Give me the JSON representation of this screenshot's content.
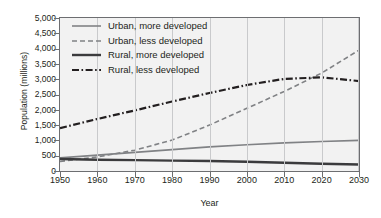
{
  "chart_data": {
    "type": "line",
    "title": "",
    "xlabel": "Year",
    "ylabel": "Population (millions)",
    "xlim": [
      1950,
      2030
    ],
    "ylim": [
      0,
      5000
    ],
    "xticks": [
      1950,
      1960,
      1970,
      1980,
      1990,
      2000,
      2010,
      2020,
      2030
    ],
    "xtick_labels": [
      "1950",
      "1960",
      "1970",
      "1980",
      "1990",
      "2000",
      "2010",
      "2020",
      "2030"
    ],
    "yticks": [
      0,
      500,
      1000,
      1500,
      2000,
      2500,
      3000,
      3500,
      4000,
      4500,
      5000
    ],
    "ytick_labels": [
      "0",
      "500",
      "1,000",
      "1,500",
      "2,000",
      "2,500",
      "3,000",
      "3,500",
      "4,000",
      "4,500",
      "5,000"
    ],
    "grid": "vertical",
    "legend_position": "upper-left-inside",
    "x": [
      1950,
      1960,
      1970,
      1980,
      1990,
      2000,
      2010,
      2020,
      2030
    ],
    "series": [
      {
        "name": "Urban, more developed",
        "values": [
          430,
          520,
          610,
          700,
          790,
          860,
          920,
          965,
          1000
        ],
        "color": "#808285",
        "style": "solid",
        "width": 1.6
      },
      {
        "name": "Urban, less developed",
        "values": [
          310,
          460,
          680,
          1010,
          1500,
          2050,
          2600,
          3200,
          3950
        ],
        "color": "#808285",
        "style": "dashed",
        "width": 1.6
      },
      {
        "name": "Rural, more developed",
        "values": [
          390,
          370,
          355,
          340,
          325,
          300,
          270,
          235,
          210
        ],
        "color": "#3b3b3d",
        "style": "solid",
        "width": 2.4
      },
      {
        "name": "Rural, less developed",
        "values": [
          1400,
          1700,
          1980,
          2270,
          2550,
          2810,
          3010,
          3060,
          2940
        ],
        "color": "#231f20",
        "style": "dashdot",
        "width": 2.2
      }
    ]
  }
}
